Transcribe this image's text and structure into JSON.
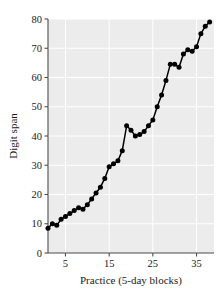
{
  "chart_data": {
    "type": "line",
    "title": "",
    "subtitle": "",
    "xlabel": "Practice (5-day blocks)",
    "ylabel": "Digit span",
    "xlim": [
      1,
      39
    ],
    "ylim": [
      0,
      80
    ],
    "xticks": [
      5,
      15,
      25,
      35
    ],
    "xtick_labels": [
      "5",
      "15",
      "25",
      "35"
    ],
    "yticks": [
      0,
      10,
      20,
      30,
      40,
      50,
      60,
      70,
      80
    ],
    "ytick_labels": [
      "0",
      "10",
      "20",
      "30",
      "40",
      "50",
      "60",
      "70",
      "80"
    ],
    "grid": true,
    "grid_color": "#ffffff",
    "plot_background": "#ececec",
    "legend": null,
    "legend_position": "none",
    "marker": "filled-circle",
    "marker_color": "#000000",
    "line_color": "#000000",
    "series": [
      {
        "name": "Digit span",
        "x": [
          1,
          2,
          3,
          4,
          5,
          6,
          7,
          8,
          9,
          10,
          11,
          12,
          13,
          14,
          15,
          16,
          17,
          18,
          19,
          20,
          21,
          22,
          23,
          24,
          25,
          26,
          27,
          28,
          29,
          30,
          31,
          32,
          33,
          34,
          35,
          36,
          37,
          38
        ],
        "values": [
          8.5,
          10.0,
          9.5,
          11.5,
          12.5,
          13.5,
          14.5,
          15.5,
          15.0,
          16.5,
          18.5,
          20.5,
          22.5,
          25.5,
          29.5,
          30.5,
          31.5,
          35.0,
          43.5,
          42.0,
          40.0,
          40.5,
          41.5,
          43.5,
          45.5,
          50.0,
          54.0,
          59.0,
          64.5,
          64.5,
          63.5,
          68.0,
          69.5,
          69.0,
          70.5,
          75.0,
          77.5,
          79.0
        ]
      }
    ]
  },
  "axes": {
    "x_axis_name": "Practice (5-day blocks)",
    "y_axis_name": "Digit span"
  }
}
